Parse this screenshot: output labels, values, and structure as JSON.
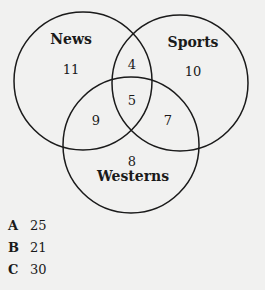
{
  "diagram": {
    "type": "venn",
    "sets": [
      {
        "name": "News",
        "cx": 83,
        "cy": 81,
        "r": 69
      },
      {
        "name": "Sports",
        "cx": 180,
        "cy": 83,
        "r": 68
      },
      {
        "name": "Westerns",
        "cx": 131,
        "cy": 145,
        "r": 68
      }
    ],
    "regions": {
      "news_only": "11",
      "sports_only": "10",
      "westerns_only": "8",
      "news_sports": "4",
      "news_westerns": "9",
      "sports_westerns": "7",
      "all_three": "5"
    },
    "stroke_color": "#1a1a1a"
  },
  "options": [
    {
      "letter": "A",
      "value": "25"
    },
    {
      "letter": "B",
      "value": "21"
    },
    {
      "letter": "C",
      "value": "30"
    }
  ]
}
